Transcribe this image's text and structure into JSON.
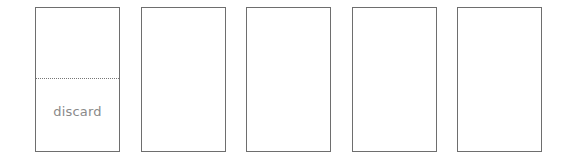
{
  "cards": [
    {
      "id": 1,
      "has_fold": true,
      "label": "discard"
    },
    {
      "id": 2,
      "has_fold": false
    },
    {
      "id": 3,
      "has_fold": false
    },
    {
      "id": 4,
      "has_fold": false
    },
    {
      "id": 5,
      "has_fold": false
    }
  ],
  "colors": {
    "border": "#6e6e6e",
    "label": "#8a8a8a",
    "background": "#ffffff"
  }
}
